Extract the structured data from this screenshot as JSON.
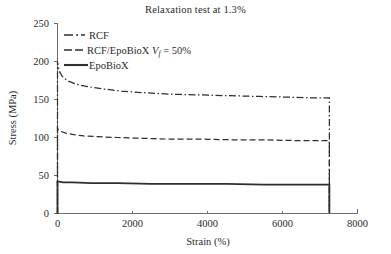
{
  "chart_data": {
    "type": "line",
    "title": "Relaxation test at 1.3%",
    "xlabel": "Strain (%)",
    "ylabel": "Stress (MPa)",
    "xlim": [
      0,
      8000
    ],
    "ylim": [
      0,
      250
    ],
    "xticks": [
      0,
      2000,
      4000,
      6000,
      8000
    ],
    "yticks": [
      0,
      50,
      100,
      150,
      200,
      250
    ],
    "xtick_labels": [
      "0",
      "2000",
      "4000",
      "6000",
      "8000"
    ],
    "ytick_labels": [
      "0",
      "50",
      "100",
      "150",
      "200",
      "250"
    ],
    "grid": false,
    "legend_position": "upper-left",
    "series": [
      {
        "name": "RCF",
        "legend_label": "RCF",
        "style": "dash-dot",
        "color": "#2f2f2f",
        "x": [
          0,
          0,
          20,
          60,
          120,
          250,
          500,
          800,
          1200,
          1700,
          2300,
          3000,
          3800,
          4600,
          5400,
          6200,
          6900,
          7250,
          7250
        ],
        "y": [
          0,
          200,
          193,
          186,
          181,
          175,
          170,
          167,
          164,
          161,
          159,
          157,
          156,
          155,
          154,
          153,
          152,
          152,
          0
        ]
      },
      {
        "name": "RCF/EpoBioX Vf = 50%",
        "legend_label": "RCF/EpoBioX V_f = 50%",
        "legend_label_prefix": "RCF/EpoBioX ",
        "legend_label_var": "V",
        "legend_label_sub": "f",
        "legend_label_suffix": " = 50%",
        "style": "dashed",
        "color": "#2f2f2f",
        "x": [
          0,
          0,
          30,
          90,
          200,
          400,
          700,
          1100,
          1600,
          2200,
          2900,
          3700,
          4600,
          5500,
          6300,
          6900,
          7250,
          7250
        ],
        "y": [
          0,
          112,
          110,
          108,
          106,
          104,
          102,
          101,
          100,
          99,
          98,
          98,
          97,
          97,
          96,
          96,
          96,
          0
        ]
      },
      {
        "name": "EpoBioX",
        "legend_label": "EpoBioX",
        "style": "solid",
        "color": "#2f2f2f",
        "x": [
          0,
          0,
          40,
          150,
          400,
          900,
          1600,
          2500,
          3500,
          4500,
          5500,
          6400,
          7100,
          7250,
          7250
        ],
        "y": [
          0,
          42,
          42,
          41,
          41,
          40,
          40,
          39,
          39,
          39,
          38,
          38,
          38,
          38,
          0
        ]
      }
    ],
    "annotations": {
      "drop_strain": 7250
    }
  },
  "legend": {
    "items": [
      {
        "label": "RCF",
        "style": "dash-dot"
      },
      {
        "label_prefix": "RCF/EpoBioX ",
        "label_var": "V",
        "label_sub": "f",
        "label_suffix": " = 50%",
        "style": "dashed"
      },
      {
        "label": "EpoBioX",
        "style": "solid"
      }
    ]
  }
}
